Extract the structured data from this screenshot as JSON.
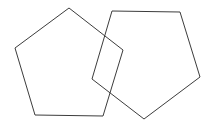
{
  "canvas": {
    "width": 211,
    "height": 123,
    "background_color": "#ffffff",
    "title": "Two overlapping pentagon outlines"
  },
  "style": {
    "stroke_color": "#3c3c3c",
    "stroke_width": 1,
    "fill": "none"
  },
  "chart_data": {
    "type": "diagram",
    "xlabel": "",
    "ylabel": "",
    "xlim": [
      0,
      211
    ],
    "ylim": [
      0,
      123
    ],
    "grid": false,
    "legend": false,
    "shape_count": 2,
    "shapes": [
      {
        "name": "left-pentagon",
        "sides": 5,
        "stroke": "#3c3c3c",
        "fill": "none",
        "points": "69,8 123,50 103,116 35,115 15,48",
        "vertices": [
          {
            "label": "top",
            "x": 69,
            "y": 8
          },
          {
            "label": "right",
            "x": 123,
            "y": 50
          },
          {
            "label": "bottom-right",
            "x": 103,
            "y": 116
          },
          {
            "label": "bottom-left",
            "x": 35,
            "y": 115
          },
          {
            "label": "left",
            "x": 15,
            "y": 48
          }
        ]
      },
      {
        "name": "right-pentagon",
        "sides": 5,
        "stroke": "#3c3c3c",
        "fill": "none",
        "points": "112,11 180,12 200,77 144,119 92,79",
        "vertices": [
          {
            "label": "top-left",
            "x": 112,
            "y": 11
          },
          {
            "label": "top-right",
            "x": 180,
            "y": 12
          },
          {
            "label": "right",
            "x": 200,
            "y": 77
          },
          {
            "label": "bottom",
            "x": 144,
            "y": 119
          },
          {
            "label": "left",
            "x": 92,
            "y": 79
          }
        ]
      }
    ],
    "overlap": {
      "description": "The two pentagons intersect, forming a small quadrilateral overlap region near the center-left",
      "intersection_points": [
        {
          "x": 106,
          "y": 28
        },
        {
          "x": 123,
          "y": 50
        },
        {
          "x": 100,
          "y": 106
        },
        {
          "x": 96,
          "y": 64
        }
      ]
    }
  }
}
